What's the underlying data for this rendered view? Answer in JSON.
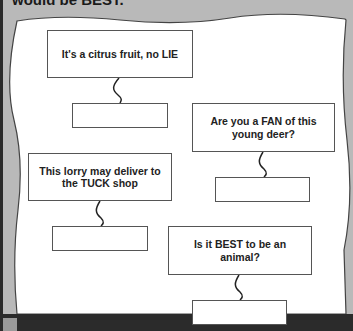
{
  "intro_text": "would be BEST.",
  "colors": {
    "background": "#b9b9b9",
    "paper": "#ffffff",
    "border": "#555555",
    "text": "#222222"
  },
  "clues": [
    {
      "text": "It's a citrus fruit, no LIE",
      "answer": ""
    },
    {
      "text": "Are you a FAN of this young deer?",
      "answer": ""
    },
    {
      "text": "This lorry may deliver to the TUCK shop",
      "answer": ""
    },
    {
      "text": "Is it BEST to be an animal?",
      "answer": ""
    }
  ]
}
